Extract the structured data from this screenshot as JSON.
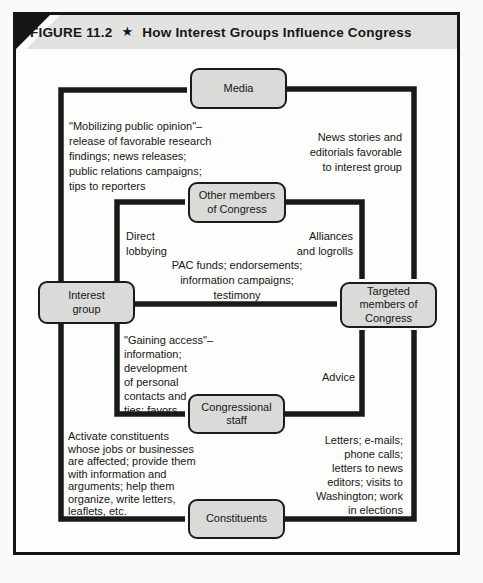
{
  "header": {
    "figure_label": "FIGURE 11.2",
    "star": "★",
    "title": "How Interest Groups Influence Congress"
  },
  "nodes": {
    "media": {
      "label": "Media"
    },
    "other_members": {
      "label": "Other members\nof Congress"
    },
    "interest_group": {
      "label": "Interest\ngroup"
    },
    "targeted_members": {
      "label": "Targeted\nmembers of\nCongress"
    },
    "congressional_staff": {
      "label": "Congressional\nstaff"
    },
    "constituents": {
      "label": "Constituents"
    }
  },
  "annotations": {
    "mobilizing": "\"Mobilizing public opinion\"–\nrelease of favorable research\nfindings; news releases;\npublic relations campaigns;\ntips to reporters",
    "news_stories": "News stories and\neditorials favorable\nto interest group",
    "direct_lobbying": "Direct\nlobbying",
    "alliances": "Alliances\nand logrolls",
    "pac_funds": "PAC funds; endorsements;\ninformation campaigns;\ntestimony",
    "gaining_access": "\"Gaining access\"–\ninformation;\ndevelopment\nof personal\ncontacts and\nties; favors",
    "advice": "Advice",
    "activate_constituents": "Activate constituents\nwhose jobs or businesses\nare affected; provide them\nwith information and\narguments; help them\norganize, write letters,\nleaflets, etc.",
    "letters": "Letters; e-mails;\nphone calls;\nletters to news\neditors; visits to\nWashington; work\nin elections"
  },
  "colors": {
    "line": "#1a1a1a",
    "box_fill": "#dadad8",
    "box_border": "#1b1b1b",
    "header_bg": "#e2e2e0",
    "frame_border": "#161616"
  }
}
